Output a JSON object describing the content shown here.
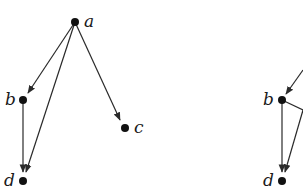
{
  "diagram": {
    "type": "directed-graph",
    "graphs": [
      {
        "id": "left",
        "nodes": [
          {
            "id": "a",
            "label": "a",
            "x": 75,
            "y": 22
          },
          {
            "id": "b",
            "label": "b",
            "x": 23,
            "y": 100
          },
          {
            "id": "c",
            "label": "c",
            "x": 125,
            "y": 128
          },
          {
            "id": "d",
            "label": "d",
            "x": 23,
            "y": 181
          }
        ],
        "edges": [
          {
            "from": "a",
            "to": "b"
          },
          {
            "from": "a",
            "to": "c"
          },
          {
            "from": "a",
            "to": "d"
          },
          {
            "from": "b",
            "to": "d"
          }
        ]
      },
      {
        "id": "right",
        "nodes": [
          {
            "id": "b",
            "label": "b",
            "x": 282,
            "y": 100
          },
          {
            "id": "d",
            "label": "d",
            "x": 282,
            "y": 181
          }
        ],
        "edges": [
          {
            "from": "offscreen",
            "to": "b"
          },
          {
            "from": "b",
            "to": "offscreen"
          },
          {
            "from": "offscreen",
            "to": "d"
          },
          {
            "from": "b",
            "to": "d"
          }
        ]
      }
    ]
  }
}
